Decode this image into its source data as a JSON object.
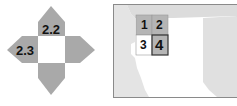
{
  "compass": {
    "labels": {
      "north": "2.2",
      "west": "2.3"
    },
    "colors": {
      "arrow": "#a9a9a9",
      "center": "#ffffff",
      "label": "#111111"
    }
  },
  "map_index": {
    "cells": [
      {
        "id": "1",
        "label": "1",
        "fill": "#b5b5b5"
      },
      {
        "id": "2",
        "label": "2",
        "fill": "#b5b5b5"
      },
      {
        "id": "3",
        "label": "3",
        "fill": "#ffffff"
      },
      {
        "id": "4",
        "label": "4",
        "fill": "#b5b5b5",
        "highlighted": true
      }
    ],
    "colors": {
      "land": "#e4e4e4",
      "water": "#ffffff",
      "frame": "#8a8a8a",
      "cell_border": "#333333"
    }
  }
}
